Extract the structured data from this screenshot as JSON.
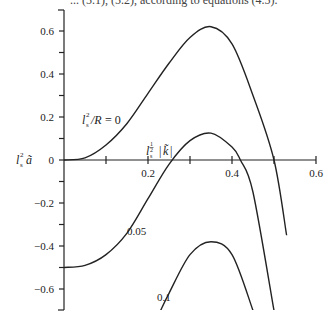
{
  "caption": "... (5.1), (5.2), according to equations (4.5).",
  "chart_data": {
    "type": "line",
    "title": "",
    "xlabel": "l_s^{1/2} |k̃|",
    "ylabel": "l_s^2 ã",
    "xlim": [
      0,
      0.6
    ],
    "ylim": [
      -0.7,
      0.7
    ],
    "x_ticks": [
      "0.2",
      "0.4",
      "0.6"
    ],
    "y_ticks": [
      "0.6",
      "0.4",
      "0.2",
      "0",
      "-0.2",
      "-0.4",
      "-0.6"
    ],
    "grid": false,
    "legend": "inline curve labels",
    "series": [
      {
        "name": "l_s^2/R = 0",
        "label": "l_s²/R = 0",
        "x": [
          0,
          0.05,
          0.1,
          0.15,
          0.2,
          0.25,
          0.3,
          0.35,
          0.4,
          0.45,
          0.5,
          0.53
        ],
        "y": [
          0,
          0.01,
          0.07,
          0.17,
          0.31,
          0.45,
          0.57,
          0.62,
          0.54,
          0.3,
          0.0,
          -0.35
        ]
      },
      {
        "name": "l_s^2/R = 0.05",
        "label": "0.05",
        "x": [
          0,
          0.05,
          0.1,
          0.15,
          0.2,
          0.25,
          0.3,
          0.35,
          0.4,
          0.42,
          0.45,
          0.5
        ],
        "y": [
          -0.5,
          -0.49,
          -0.44,
          -0.34,
          -0.18,
          -0.02,
          0.09,
          0.125,
          0.06,
          0.0,
          -0.15,
          -0.7
        ]
      },
      {
        "name": "l_s^2/R = 0.1",
        "label": "0.1",
        "x": [
          0.23,
          0.25,
          0.3,
          0.35,
          0.4,
          0.45
        ],
        "y": [
          -0.7,
          -0.62,
          -0.44,
          -0.38,
          -0.44,
          -0.7
        ]
      }
    ]
  },
  "labels": {
    "ylabel": "l",
    "xlabel": "l",
    "curve0": "= 0",
    "curve1": "0.05",
    "curve2": "0.1"
  }
}
